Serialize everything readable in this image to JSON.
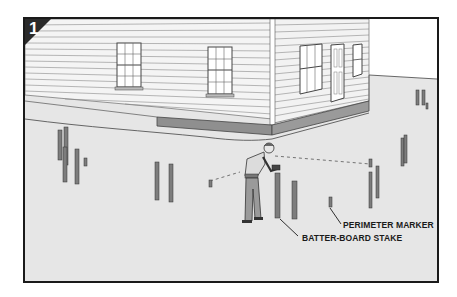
{
  "figure": {
    "step_number": "1",
    "labels": {
      "perimeter_marker": "PERIMETER MARKER",
      "batter_board_stake": "BATTER-BOARD STAKE"
    },
    "colors": {
      "frame_border": "#1a1a1a",
      "ground": "#e6e6e6",
      "siding": "#f4f4f4",
      "siding_line": "#8a8a8a",
      "foundation": "#8f8f8f",
      "stake": "#7d7d7d",
      "badge": "#2a2a2a"
    },
    "illustration": {
      "subject": "worker driving batter-board stakes around house perimeter",
      "elements": [
        "house",
        "windows",
        "door",
        "foundation",
        "worker",
        "sledgehammer",
        "batter-board stakes",
        "perimeter markers",
        "string line"
      ]
    }
  }
}
